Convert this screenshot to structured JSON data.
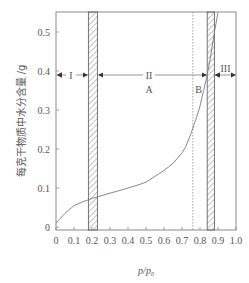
{
  "chart_data": {
    "type": "line",
    "title": "",
    "xlabel": "p/p₀",
    "ylabel": "每克干物质中水分含量 /g",
    "xlim": [
      0,
      1.0
    ],
    "ylim": [
      0,
      0.55
    ],
    "x_ticks": [
      "0",
      "0.1",
      "0.2",
      "0.3",
      "0.4",
      "0.5",
      "0.6",
      "0.7",
      "0.8",
      "0.9",
      "1.0"
    ],
    "y_ticks": [
      "0",
      "0.1",
      "0.2",
      "0.3",
      "0.4",
      "0.5"
    ],
    "grid": false,
    "legend": null,
    "series": [
      {
        "name": "moisture sorption isotherm",
        "x": [
          0.0,
          0.02,
          0.05,
          0.1,
          0.15,
          0.2,
          0.25,
          0.3,
          0.35,
          0.4,
          0.45,
          0.5,
          0.55,
          0.6,
          0.65,
          0.7,
          0.72,
          0.75,
          0.78,
          0.8,
          0.82,
          0.84,
          0.86,
          0.88,
          0.9
        ],
        "y": [
          0.01,
          0.02,
          0.035,
          0.055,
          0.065,
          0.073,
          0.08,
          0.087,
          0.093,
          0.1,
          0.107,
          0.115,
          0.13,
          0.145,
          0.163,
          0.19,
          0.205,
          0.24,
          0.28,
          0.31,
          0.35,
          0.39,
          0.44,
          0.5,
          0.55
        ]
      }
    ],
    "regions": [
      {
        "label": "I",
        "x_from": 0.0,
        "x_to": 0.2,
        "y": 0.4
      },
      {
        "label": "II",
        "x_from": 0.23,
        "x_to": 0.84,
        "y": 0.4
      },
      {
        "label": "III",
        "x_from": 0.88,
        "x_to": 1.0,
        "y": 0.4
      }
    ],
    "hatched_bands": [
      {
        "x_from": 0.18,
        "x_to": 0.23
      },
      {
        "x_from": 0.84,
        "x_to": 0.88
      }
    ],
    "vertical_dotted_line": {
      "x": 0.76
    },
    "annotations": [
      {
        "text": "A",
        "x": 0.5,
        "y": 0.37
      },
      {
        "text": "B",
        "x": 0.79,
        "y": 0.37
      }
    ]
  },
  "labels": {
    "region_1": "I",
    "region_2": "II",
    "region_3": "III",
    "zone_a": "A",
    "zone_b": "B",
    "x_axis": "p/p",
    "x_axis_sub": "0",
    "y_axis": "每克干物质中水分含量 /g"
  },
  "colors": {
    "axis": "#8a8a8a",
    "curve": "#7a7a7a",
    "text": "#555555",
    "hatch": "#777777"
  }
}
